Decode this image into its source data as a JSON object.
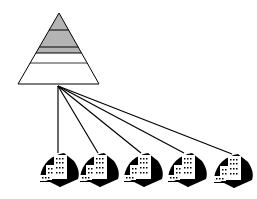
{
  "diagram": {
    "type": "hierarchy",
    "pyramid": {
      "apex": [
        59,
        13
      ],
      "base_left": [
        18,
        84
      ],
      "base_right": [
        99,
        84
      ],
      "bands": [
        {
          "y_top": 13,
          "y_bottom": 30,
          "fill": "#b4b4b4"
        },
        {
          "y_top": 30,
          "y_bottom": 47,
          "fill": "#b4b4b4"
        },
        {
          "y_top": 47,
          "y_bottom": 53,
          "fill": "#b4b4b4"
        },
        {
          "y_top": 53,
          "y_bottom": 63,
          "fill": "#ffffff"
        },
        {
          "y_top": 63,
          "y_bottom": 84,
          "fill": "#ffffff"
        }
      ]
    },
    "hub": [
      58,
      86
    ],
    "nodes": [
      {
        "name": "building-1",
        "x": 55,
        "top": 153
      },
      {
        "name": "building-2",
        "x": 97,
        "top": 153
      },
      {
        "name": "building-3",
        "x": 140,
        "top": 153
      },
      {
        "name": "building-4",
        "x": 184,
        "top": 153
      },
      {
        "name": "building-5",
        "x": 231,
        "top": 154
      }
    ],
    "colors": {
      "stroke": "#000000",
      "shaded": "#b4b4b4",
      "background": "#ffffff"
    }
  }
}
